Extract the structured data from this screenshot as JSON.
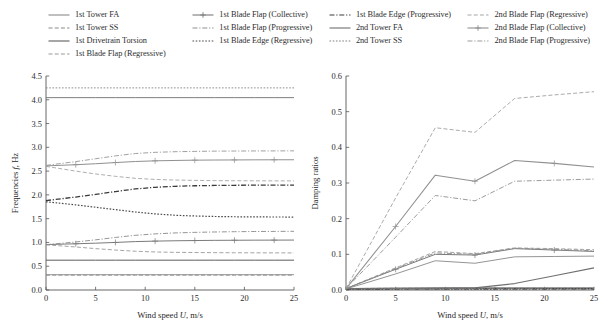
{
  "legend": {
    "columns": [
      {
        "entries": [
          {
            "label": "1st Tower FA",
            "style": "solid",
            "color": "#8a8a8a",
            "marker": "none"
          },
          {
            "label": "1st Tower SS",
            "style": "dashed",
            "color": "#8a8a8a",
            "marker": "none"
          },
          {
            "label": "1st Drivetrain Torsion",
            "style": "solid",
            "color": "#5d5d5d",
            "marker": "none"
          },
          {
            "label": "1st Blade Flap (Regressive)",
            "style": "dashed",
            "color": "#9a9a9a",
            "marker": "none"
          }
        ]
      },
      {
        "entries": [
          {
            "label": "1st Blade Flap (Collective)",
            "style": "solid",
            "color": "#7a7a7a",
            "marker": "plus"
          },
          {
            "label": "1st Blade Flap (Progressive)",
            "style": "dashdot",
            "color": "#8f8f8f",
            "marker": "none"
          },
          {
            "label": "1st Blade Edge (Regressive)",
            "style": "dotted",
            "color": "#4a4a4a",
            "marker": "none"
          }
        ]
      },
      {
        "entries": [
          {
            "label": "1st Blade Edge (Progressive)",
            "style": "dashdot",
            "color": "#3a3a3a",
            "marker": "none"
          },
          {
            "label": "2nd Tower FA",
            "style": "solid",
            "color": "#6f6f6f",
            "marker": "none"
          },
          {
            "label": "2nd Tower SS",
            "style": "dotted",
            "color": "#7e7e7e",
            "marker": "none"
          }
        ]
      },
      {
        "entries": [
          {
            "label": "2nd Blade Flap (Regressive)",
            "style": "dashed",
            "color": "#a5a5a5",
            "marker": "none"
          },
          {
            "label": "2nd Blade Flap (Collective)",
            "style": "solid",
            "color": "#909090",
            "marker": "plus"
          },
          {
            "label": "2nd Blade Flap (Progressive)",
            "style": "dashdot",
            "color": "#9c9c9c",
            "marker": "none"
          }
        ]
      }
    ]
  },
  "chart_data": [
    {
      "id": "frequencies",
      "type": "line",
      "title": "",
      "xlabel_text": "Wind speed U, m/s",
      "xlabel_plain": "Wind speed",
      "xlabel_symbol": "U",
      "xlabel_unit": ", m/s",
      "ylabel_text": "Frequencies f, Hz",
      "ylabel_plain": "Frequencies",
      "ylabel_symbol": "f",
      "ylabel_unit": ", Hz",
      "xlim": [
        0,
        25
      ],
      "ylim": [
        0.0,
        4.5
      ],
      "xticks": [
        0,
        5,
        10,
        15,
        20,
        25
      ],
      "yticks": [
        "0.0",
        "0.5",
        "1.0",
        "1.5",
        "2.0",
        "2.5",
        "3.0",
        "3.5",
        "4.0",
        "4.5"
      ],
      "ytick_values": [
        0.0,
        0.5,
        1.0,
        1.5,
        2.0,
        2.5,
        3.0,
        3.5,
        4.0,
        4.5
      ],
      "grid": false,
      "x": [
        0,
        3,
        5,
        7,
        9,
        11,
        13,
        15,
        17,
        19,
        21,
        23,
        25
      ],
      "series": [
        {
          "name": "1st Tower FA",
          "style": "solid",
          "color": "#8a8a8a",
          "width": 0.9,
          "marker": "none",
          "values": [
            0.322,
            0.322,
            0.322,
            0.322,
            0.322,
            0.322,
            0.322,
            0.322,
            0.322,
            0.322,
            0.322,
            0.322,
            0.322
          ]
        },
        {
          "name": "1st Tower SS",
          "style": "dashed",
          "color": "#8a8a8a",
          "width": 0.9,
          "marker": "none",
          "values": [
            0.312,
            0.312,
            0.312,
            0.312,
            0.312,
            0.312,
            0.312,
            0.312,
            0.312,
            0.312,
            0.312,
            0.312,
            0.312
          ]
        },
        {
          "name": "1st Drivetrain Torsion",
          "style": "solid",
          "color": "#5d5d5d",
          "width": 1.0,
          "marker": "none",
          "values": [
            0.627,
            0.627,
            0.627,
            0.627,
            0.627,
            0.627,
            0.627,
            0.627,
            0.627,
            0.627,
            0.627,
            0.627,
            0.627
          ]
        },
        {
          "name": "1st Blade Flap (Regressive)",
          "style": "dashed",
          "color": "#9a9a9a",
          "width": 0.9,
          "marker": "none",
          "values": [
            0.95,
            0.905,
            0.87,
            0.84,
            0.815,
            0.8,
            0.792,
            0.788,
            0.785,
            0.783,
            0.782,
            0.781,
            0.78
          ]
        },
        {
          "name": "1st Blade Flap (Collective)",
          "style": "solid",
          "color": "#7a7a7a",
          "width": 1.0,
          "marker": "plus",
          "values": [
            0.955,
            0.972,
            0.985,
            1.0,
            1.018,
            1.028,
            1.035,
            1.04,
            1.044,
            1.046,
            1.048,
            1.049,
            1.05
          ]
        },
        {
          "name": "1st Blade Flap (Progressive)",
          "style": "dashdot",
          "color": "#8f8f8f",
          "width": 0.95,
          "marker": "none",
          "values": [
            0.952,
            1.01,
            1.055,
            1.105,
            1.15,
            1.18,
            1.2,
            1.212,
            1.22,
            1.226,
            1.23,
            1.232,
            1.234
          ]
        },
        {
          "name": "1st Blade Edge (Regressive)",
          "style": "dotted",
          "color": "#4a4a4a",
          "width": 1.2,
          "marker": "none",
          "values": [
            1.855,
            1.79,
            1.74,
            1.69,
            1.64,
            1.6,
            1.572,
            1.556,
            1.546,
            1.54,
            1.537,
            1.535,
            1.534
          ]
        },
        {
          "name": "1st Blade Edge (Progressive)",
          "style": "dashdot",
          "color": "#3a3a3a",
          "width": 1.3,
          "marker": "none",
          "values": [
            1.88,
            1.955,
            2.01,
            2.07,
            2.125,
            2.16,
            2.18,
            2.192,
            2.198,
            2.202,
            2.205,
            2.206,
            2.207
          ]
        },
        {
          "name": "2nd Tower FA",
          "style": "solid",
          "color": "#6f6f6f",
          "width": 0.9,
          "marker": "none",
          "values": [
            4.045,
            4.045,
            4.045,
            4.045,
            4.045,
            4.045,
            4.045,
            4.045,
            4.045,
            4.045,
            4.045,
            4.045,
            4.045
          ]
        },
        {
          "name": "2nd Tower SS",
          "style": "dotted",
          "color": "#7e7e7e",
          "width": 0.9,
          "marker": "none",
          "values": [
            4.25,
            4.25,
            4.25,
            4.25,
            4.25,
            4.25,
            4.25,
            4.25,
            4.25,
            4.25,
            4.25,
            4.25,
            4.25
          ]
        },
        {
          "name": "2nd Blade Flap (Regressive)",
          "style": "dashed",
          "color": "#a5a5a5",
          "width": 0.9,
          "marker": "none",
          "values": [
            2.6,
            2.5,
            2.44,
            2.39,
            2.348,
            2.325,
            2.312,
            2.305,
            2.3,
            2.298,
            2.296,
            2.295,
            2.294
          ]
        },
        {
          "name": "2nd Blade Flap (Collective)",
          "style": "solid",
          "color": "#909090",
          "width": 1.0,
          "marker": "plus",
          "values": [
            2.61,
            2.635,
            2.655,
            2.68,
            2.702,
            2.716,
            2.724,
            2.73,
            2.733,
            2.735,
            2.737,
            2.738,
            2.739
          ]
        },
        {
          "name": "2nd Blade Flap (Progressive)",
          "style": "dashdot",
          "color": "#9c9c9c",
          "width": 0.95,
          "marker": "none",
          "values": [
            2.62,
            2.7,
            2.76,
            2.82,
            2.87,
            2.895,
            2.908,
            2.915,
            2.92,
            2.922,
            2.924,
            2.925,
            2.926
          ]
        }
      ]
    },
    {
      "id": "damping",
      "type": "line",
      "title": "",
      "xlabel_text": "Wind speed U, m/s",
      "xlabel_plain": "Wind speed",
      "xlabel_symbol": "U",
      "xlabel_unit": ", m/s",
      "ylabel_text": "Damping ratios",
      "ylabel_plain": "Damping ratios",
      "ylabel_symbol": "",
      "ylabel_unit": "",
      "xlim": [
        0,
        25
      ],
      "ylim": [
        0.0,
        0.6
      ],
      "xticks": [
        0,
        5,
        10,
        15,
        20,
        25
      ],
      "yticks": [
        "0.0",
        "0.1",
        "0.2",
        "0.3",
        "0.4",
        "0.5",
        "0.6"
      ],
      "ytick_values": [
        0.0,
        0.1,
        0.2,
        0.3,
        0.4,
        0.5,
        0.6
      ],
      "grid": false,
      "x": [
        0,
        5,
        9,
        13,
        17,
        21,
        25
      ],
      "series": [
        {
          "name": "1st Tower FA",
          "style": "solid",
          "color": "#8a8a8a",
          "width": 0.9,
          "marker": "none",
          "values": [
            0.004,
            0.006,
            0.006,
            0.006,
            0.006,
            0.006,
            0.006
          ]
        },
        {
          "name": "1st Tower SS",
          "style": "dashed",
          "color": "#8a8a8a",
          "width": 0.9,
          "marker": "none",
          "values": [
            0.004,
            0.005,
            0.005,
            0.005,
            0.005,
            0.005,
            0.005
          ]
        },
        {
          "name": "1st Drivetrain Torsion",
          "style": "solid",
          "color": "#5d5d5d",
          "width": 1.0,
          "marker": "none",
          "values": [
            0.003,
            0.004,
            0.005,
            0.005,
            0.005,
            0.005,
            0.005
          ]
        },
        {
          "name": "1st Blade Flap (Regressive)",
          "style": "dashed",
          "color": "#9a9a9a",
          "width": 0.9,
          "marker": "none",
          "values": [
            0.004,
            0.062,
            0.108,
            0.102,
            0.118,
            0.116,
            0.113
          ]
        },
        {
          "name": "1st Blade Flap (Collective)",
          "style": "solid",
          "color": "#7a7a7a",
          "width": 1.0,
          "marker": "plus",
          "values": [
            0.004,
            0.058,
            0.1,
            0.098,
            0.116,
            0.112,
            0.108
          ]
        },
        {
          "name": "1st Blade Flap (Progressive)",
          "style": "dashdot",
          "color": "#8f8f8f",
          "width": 0.95,
          "marker": "none",
          "values": [
            0.004,
            0.06,
            0.104,
            0.1,
            0.117,
            0.114,
            0.11
          ]
        },
        {
          "name": "1st Blade Edge (Regressive)",
          "style": "dotted",
          "color": "#4a4a4a",
          "width": 1.2,
          "marker": "none",
          "values": [
            0.002,
            0.003,
            0.003,
            0.003,
            0.004,
            0.004,
            0.004
          ]
        },
        {
          "name": "1st Blade Edge (Progressive)",
          "style": "dashdot",
          "color": "#3a3a3a",
          "width": 1.3,
          "marker": "none",
          "values": [
            0.002,
            0.003,
            0.003,
            0.003,
            0.003,
            0.003,
            0.003
          ]
        },
        {
          "name": "2nd Tower FA",
          "style": "solid",
          "color": "#6f6f6f",
          "width": 1.1,
          "marker": "none",
          "values": [
            0.003,
            0.004,
            0.005,
            0.006,
            0.018,
            0.04,
            0.062
          ]
        },
        {
          "name": "2nd Tower SS",
          "style": "dotted",
          "color": "#7e7e7e",
          "width": 0.9,
          "marker": "none",
          "values": [
            0.003,
            0.004,
            0.004,
            0.004,
            0.004,
            0.004,
            0.004
          ]
        },
        {
          "name": "2nd Blade Flap (Regressive)",
          "style": "dashed",
          "color": "#a5a5a5",
          "width": 0.95,
          "marker": "none",
          "values": [
            0.004,
            0.258,
            0.455,
            0.442,
            0.537,
            0.547,
            0.556
          ]
        },
        {
          "name": "2nd Blade Flap (Collective)",
          "style": "solid",
          "color": "#909090",
          "width": 1.05,
          "marker": "plus",
          "values": [
            0.004,
            0.178,
            0.322,
            0.305,
            0.363,
            0.355,
            0.345
          ]
        },
        {
          "name": "2nd Blade Flap (Progressive)",
          "style": "dashdot",
          "color": "#9c9c9c",
          "width": 1.0,
          "marker": "none",
          "values": [
            0.004,
            0.148,
            0.265,
            0.25,
            0.305,
            0.308,
            0.311
          ]
        },
        {
          "name": "2nd Tower FA lower",
          "style": "solid",
          "color": "#888888",
          "width": 0.9,
          "marker": "none",
          "values": [
            0.003,
            0.045,
            0.082,
            0.075,
            0.093,
            0.094,
            0.095
          ]
        }
      ]
    }
  ]
}
